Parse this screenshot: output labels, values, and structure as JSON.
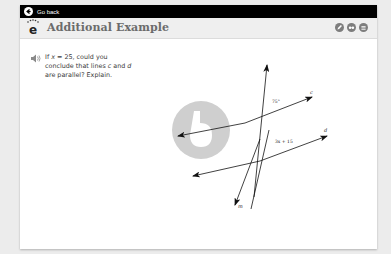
{
  "topbar": {
    "back_label": "Go back",
    "back_icon": "arrow-left-circle-icon"
  },
  "header": {
    "logo_letter": "e",
    "title": "Additional Example",
    "tools": [
      {
        "name": "pencil-icon"
      },
      {
        "name": "glasses-icon"
      },
      {
        "name": "menu-icon"
      }
    ]
  },
  "question": {
    "audio_icon": "speaker-icon",
    "line1_prefix": "If ",
    "var_x": "x",
    "line1_suffix": " = 25, could you",
    "line2_prefix": "conclude that lines ",
    "var_c": "c",
    "line2_mid": " and ",
    "var_d": "d",
    "line3": "are parallel? Explain."
  },
  "figure": {
    "line_c_label": "c",
    "line_d_label": "d",
    "line_m_label": "m",
    "angle_c_label": "75°",
    "angle_d_label": "3x + 15"
  },
  "colors": {
    "topbar": "#000000",
    "header_bg": "#efefef",
    "title": "#6b6b6b",
    "watermark": "#cfcfcf"
  }
}
